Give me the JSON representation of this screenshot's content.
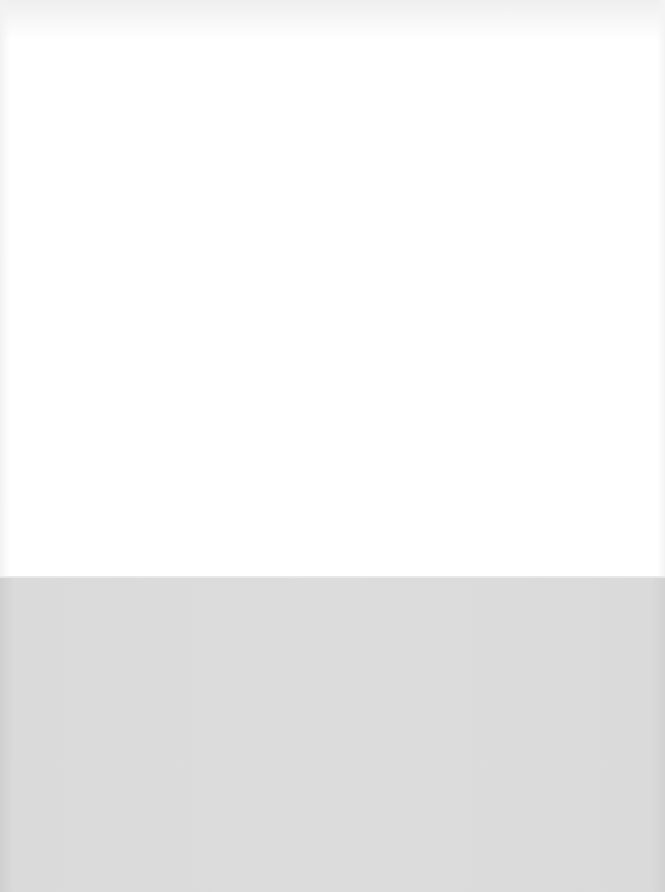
{
  "document": {
    "page_type": "blank scanned page",
    "content_text": "",
    "colors": {
      "paper": "#ffffff",
      "backing": "#d9d9d9"
    }
  }
}
